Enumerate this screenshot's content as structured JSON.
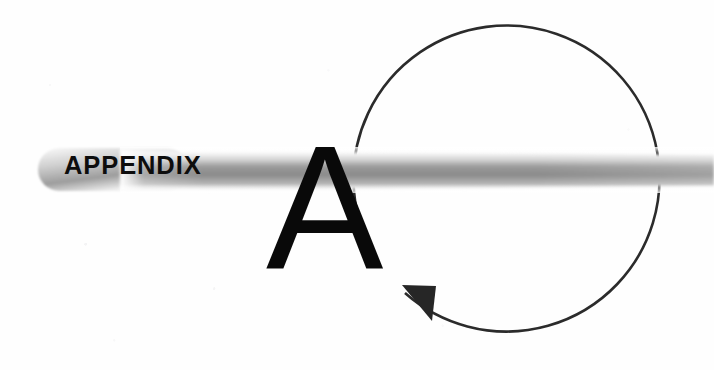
{
  "page": {
    "kind": "appendix-divider",
    "width": 714,
    "height": 370,
    "background_color": "#fefefe"
  },
  "banner": {
    "label": "APPENDIX",
    "label_color": "#0d0d0d",
    "bar_color_dark": "#8d8d8d",
    "bar_color_light": "#f4f4f4",
    "start_x": 38,
    "end_x": 714,
    "center_y": 170
  },
  "letter": {
    "text": "A",
    "color": "#090909"
  },
  "circle_arrow": {
    "stroke_color": "#2b2b2b",
    "arrowhead_color": "#262626",
    "center_x": 512,
    "center_y": 183,
    "radius": 153,
    "gap_start_deg": 208,
    "gap_end_deg": 236
  },
  "icons": {
    "circular_arrow": "circular-arrow-icon",
    "arrowhead": "arrowhead-icon"
  }
}
